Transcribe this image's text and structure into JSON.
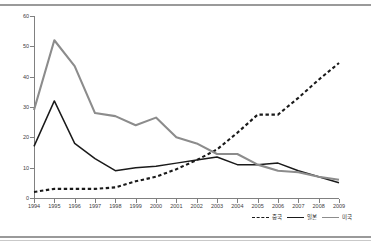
{
  "chart_data": {
    "type": "line",
    "title": "",
    "xlabel": "",
    "ylabel": "",
    "categories": [
      "1994",
      "1995",
      "1996",
      "1997",
      "1998",
      "1999",
      "2000",
      "2001",
      "2002",
      "2003",
      "2004",
      "2005",
      "2006",
      "2007",
      "2008",
      "2009"
    ],
    "ylim": [
      0,
      60
    ],
    "yticks": [
      0,
      10,
      20,
      30,
      40,
      50,
      60
    ],
    "grid": false,
    "legend_position": "bottom-right",
    "series": [
      {
        "name": "중국",
        "style": "dashed",
        "color": "#1a1a1a",
        "values": [
          2,
          3,
          3,
          3,
          3.5,
          5.5,
          7,
          9.5,
          12.5,
          16,
          21.5,
          27.5,
          27.5,
          33,
          39,
          44.5
        ]
      },
      {
        "name": "일본",
        "style": "solid",
        "color": "#1a1a1a",
        "values": [
          17,
          32,
          18,
          13,
          9,
          10,
          10.5,
          11.5,
          12.5,
          13.5,
          11,
          11,
          11.5,
          9,
          7,
          5
        ]
      },
      {
        "name": "미국",
        "style": "solid",
        "color": "#8c8c8c",
        "values": [
          29,
          52,
          43.5,
          28,
          27,
          24,
          26.5,
          20,
          18,
          14.5,
          14.5,
          11,
          9,
          8.5,
          7,
          6
        ]
      }
    ]
  },
  "legend": {
    "items": [
      {
        "label": "중국"
      },
      {
        "label": "일본"
      },
      {
        "label": "미국"
      }
    ]
  },
  "colors": {
    "china_line": "#1a1a1a",
    "japan_line": "#1a1a1a",
    "usa_line": "#8c8c8c",
    "axis": "#808080",
    "frame": "#9a9a9a"
  }
}
